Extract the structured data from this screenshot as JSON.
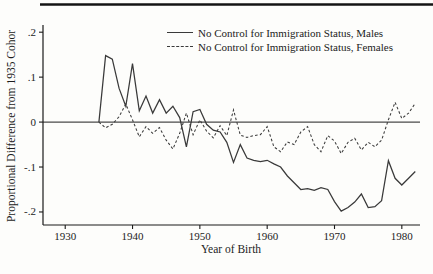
{
  "colors": {
    "line": "#3a3a3a",
    "axis": "#1a1a1a",
    "zero_line": "#4a4a4a",
    "top_rule": "#141414",
    "background": "#fdfdfb"
  },
  "chart_data": {
    "type": "line",
    "title": "",
    "xlabel": "Year of Birth",
    "ylabel": "Proportional Difference from 1935 Cohor",
    "xlim": [
      1926.7,
      1982.7
    ],
    "ylim": [
      -0.229,
      0.216
    ],
    "grid": false,
    "zero_reference_line": true,
    "legend_position": "top-inside",
    "x_ticks": [
      1930,
      1940,
      1950,
      1960,
      1970,
      1980
    ],
    "y_ticks": [
      {
        "value": 0.2,
        "label": ".2"
      },
      {
        "value": 0.1,
        "label": ".1"
      },
      {
        "value": 0,
        "label": "0"
      },
      {
        "value": -0.1,
        "label": "-.1"
      },
      {
        "value": -0.2,
        "label": "-.2"
      }
    ],
    "legend": [
      {
        "label": "No Control for Immigration Status, Males",
        "style": "solid"
      },
      {
        "label": "No Control for Immigration Status, Females",
        "style": "dashed"
      }
    ],
    "x_years": [
      1935,
      1936,
      1937,
      1938,
      1939,
      1940,
      1941,
      1942,
      1943,
      1944,
      1945,
      1946,
      1947,
      1948,
      1949,
      1950,
      1951,
      1952,
      1953,
      1954,
      1955,
      1956,
      1957,
      1958,
      1959,
      1960,
      1961,
      1962,
      1963,
      1964,
      1965,
      1966,
      1967,
      1968,
      1969,
      1970,
      1971,
      1972,
      1973,
      1974,
      1975,
      1976,
      1977,
      1978,
      1979,
      1980,
      1981,
      1982
    ],
    "series": [
      {
        "name": "No Control for Immigration Status, Males",
        "style": "solid",
        "values": [
          0,
          0.148,
          0.14,
          0.075,
          0.035,
          0.13,
          0.025,
          0.058,
          0.02,
          0.05,
          0.02,
          0.035,
          0.01,
          -0.055,
          0.023,
          0.028,
          -0.005,
          -0.018,
          -0.022,
          -0.045,
          -0.09,
          -0.05,
          -0.08,
          -0.085,
          -0.088,
          -0.085,
          -0.093,
          -0.1,
          -0.12,
          -0.135,
          -0.15,
          -0.148,
          -0.152,
          -0.146,
          -0.15,
          -0.177,
          -0.198,
          -0.19,
          -0.178,
          -0.16,
          -0.19,
          -0.188,
          -0.175,
          -0.086,
          -0.125,
          -0.14,
          -0.125,
          -0.11
        ]
      },
      {
        "name": "No Control for Immigration Status, Females",
        "style": "dashed",
        "values": [
          0,
          -0.013,
          -0.005,
          0.012,
          0.04,
          0.005,
          -0.033,
          -0.01,
          -0.025,
          -0.012,
          -0.04,
          -0.06,
          -0.025,
          0.02,
          -0.028,
          0.005,
          -0.02,
          -0.035,
          -0.008,
          -0.03,
          0.027,
          -0.029,
          -0.034,
          -0.03,
          -0.028,
          -0.01,
          -0.055,
          -0.066,
          -0.044,
          -0.05,
          -0.022,
          -0.01,
          -0.05,
          -0.066,
          -0.03,
          -0.042,
          -0.07,
          -0.045,
          -0.036,
          -0.062,
          -0.045,
          -0.055,
          -0.04,
          0.005,
          0.044,
          0.008,
          0.02,
          0.042
        ]
      }
    ]
  }
}
